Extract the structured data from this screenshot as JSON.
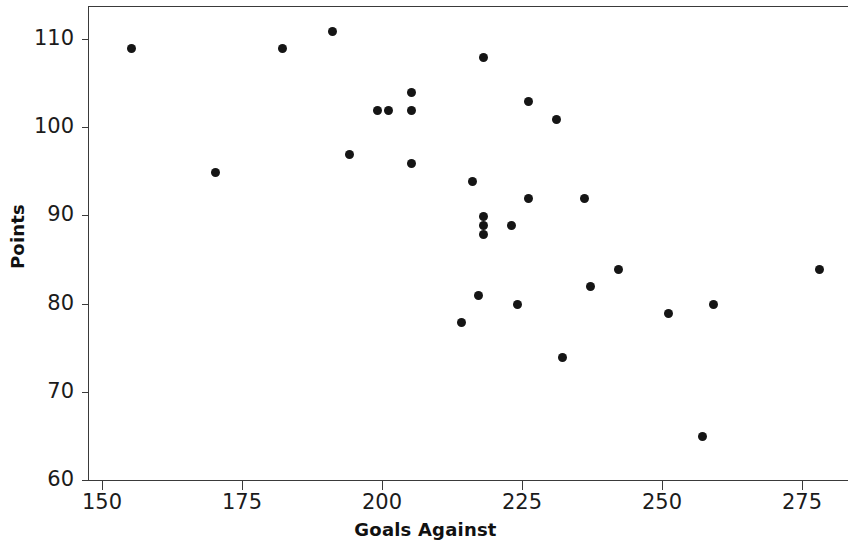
{
  "chart_data": {
    "type": "scatter",
    "title": "",
    "xlabel": "Goals Against",
    "ylabel": "Points",
    "xlim": [
      148,
      284
    ],
    "ylim": [
      60,
      114
    ],
    "xticks": [
      150,
      175,
      200,
      225,
      250,
      275
    ],
    "yticks": [
      60,
      70,
      80,
      90,
      100,
      110
    ],
    "grid": false,
    "legend": null,
    "marker": "filled-circle",
    "marker_color": "#151515",
    "axis_color": "#3a3a3a",
    "background": "#ffffff",
    "points": [
      {
        "x": 155,
        "y": 109
      },
      {
        "x": 170,
        "y": 95
      },
      {
        "x": 182,
        "y": 109
      },
      {
        "x": 191,
        "y": 111
      },
      {
        "x": 194,
        "y": 97
      },
      {
        "x": 199,
        "y": 102
      },
      {
        "x": 201,
        "y": 102
      },
      {
        "x": 205,
        "y": 104
      },
      {
        "x": 205,
        "y": 102
      },
      {
        "x": 205,
        "y": 96
      },
      {
        "x": 214,
        "y": 78
      },
      {
        "x": 216,
        "y": 94
      },
      {
        "x": 217,
        "y": 81
      },
      {
        "x": 218,
        "y": 108
      },
      {
        "x": 218,
        "y": 90
      },
      {
        "x": 218,
        "y": 89
      },
      {
        "x": 218,
        "y": 88
      },
      {
        "x": 223,
        "y": 89
      },
      {
        "x": 224,
        "y": 80
      },
      {
        "x": 226,
        "y": 103
      },
      {
        "x": 226,
        "y": 92
      },
      {
        "x": 231,
        "y": 101
      },
      {
        "x": 232,
        "y": 74
      },
      {
        "x": 236,
        "y": 92
      },
      {
        "x": 237,
        "y": 82
      },
      {
        "x": 242,
        "y": 84
      },
      {
        "x": 251,
        "y": 79
      },
      {
        "x": 257,
        "y": 65
      },
      {
        "x": 259,
        "y": 80
      },
      {
        "x": 278,
        "y": 84
      }
    ]
  },
  "axes": {
    "x_title": "Goals Against",
    "y_title": "Points",
    "x_tick_labels": [
      "150",
      "175",
      "200",
      "225",
      "250",
      "275"
    ],
    "y_tick_labels": [
      "60",
      "70",
      "80",
      "90",
      "100",
      "110"
    ]
  }
}
